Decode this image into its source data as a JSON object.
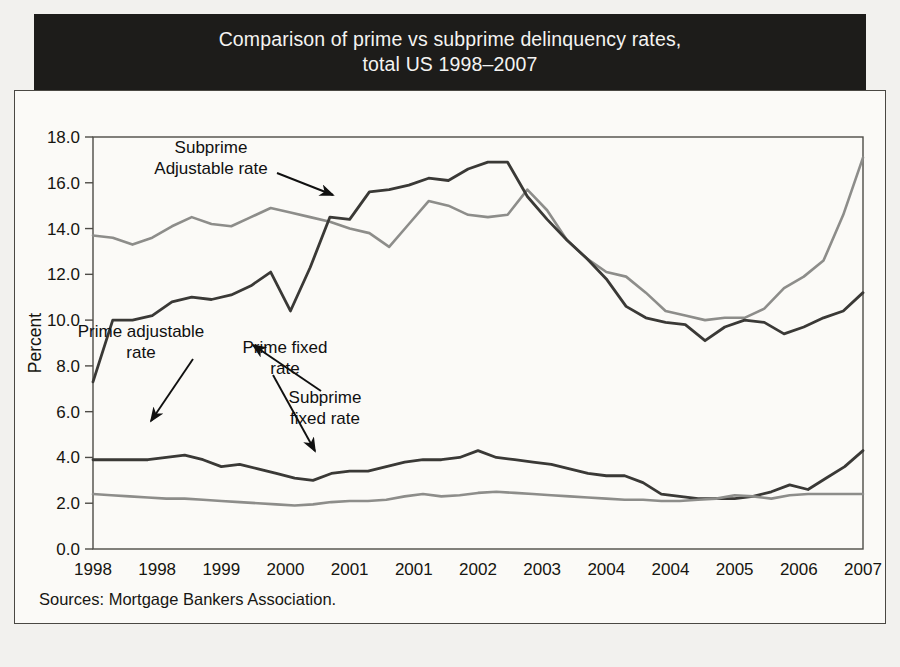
{
  "figure": {
    "title_line1": "Comparison of prime vs subprime delinquency rates,",
    "title_line2": "total US 1998–2007",
    "source": "Sources: Mortgage Bankers Association."
  },
  "colors": {
    "title_bg": "#1d1c1a",
    "title_fg": "#f4f3f1",
    "panel_bg": "#fbfaf7",
    "frame": "#4a4843",
    "subprime_adjustable": "#8d8d8a",
    "subprime_fixed": "#3a3936",
    "prime_adjustable": "#3a3936",
    "prime_fixed": "#8d8d8a"
  },
  "ghost_text": "quarter of 2007 are below the peak level of the third quarter of 2006. Since\nApril 2007, house prices fell in seventeen of the twenty metropolitan areas\nincluded in the index. Data from the national indices show a wide range of\nvalues, but those declines have been substantial in certain regions of the\ncountry.\n\nThe rise in delinquency rates in the subprime sector is shown\nin Fig. 2. Delinquency rates on subprime adjustable rate mortgages\nbottomed in 2004 at 10.0%, with a rise to 17.3% at year end 2007.\nThe prime sector remains substantially more stable: prime fixed rate\nloans hover near 2% and one might conclude that the delinquency rate\nin the prime market has not risen dramatically. Yet, the declines in 2007\nwere very sharp.\n\nThe subprime market accounts for a large share of all foreclosures, as\nsubprime originations, adjustable lending expanded and increased sharply\nin recent years. Thus, it may have been the case that some of the rise in",
  "chart_data": {
    "type": "line",
    "title": "Comparison of prime vs subprime delinquency rates, total US 1998–2007",
    "xlabel": "",
    "ylabel": "Percent",
    "ylim": [
      0.0,
      18.0
    ],
    "yticks": [
      0.0,
      2.0,
      4.0,
      6.0,
      8.0,
      10.0,
      12.0,
      14.0,
      16.0,
      18.0
    ],
    "ytick_labels": [
      "0.0",
      "2.0",
      "4.0",
      "6.0",
      "8.0",
      "10.0",
      "12.0",
      "14.0",
      "16.0",
      "18.0"
    ],
    "xtick_labels": [
      "1998",
      "1998",
      "1999",
      "2000",
      "2001",
      "2001",
      "2002",
      "2003",
      "2004",
      "2004",
      "2005",
      "2006",
      "2007"
    ],
    "x_index": [
      0,
      3,
      6,
      9,
      12,
      15,
      18,
      21,
      24,
      27,
      30,
      33,
      36
    ],
    "n_points": 40,
    "grid": false,
    "legend": "annotations",
    "series": [
      {
        "name": "Subprime Adjustable rate",
        "color": "#8d8d8a",
        "values": [
          13.7,
          13.6,
          13.3,
          13.6,
          14.1,
          14.5,
          14.2,
          14.1,
          14.5,
          14.9,
          14.7,
          14.5,
          14.3,
          14.0,
          13.8,
          13.2,
          14.2,
          15.2,
          15.0,
          14.6,
          14.5,
          14.6,
          15.7,
          14.8,
          13.5,
          12.7,
          12.1,
          11.9,
          11.2,
          10.4,
          10.2,
          10.0,
          10.1,
          10.1,
          10.5,
          11.4,
          11.9,
          12.6,
          14.6,
          17.1
        ]
      },
      {
        "name": "Subprime fixed rate",
        "color": "#3a3936",
        "values": [
          7.3,
          10.0,
          10.0,
          10.2,
          10.8,
          11.0,
          10.9,
          11.1,
          11.5,
          12.1,
          10.4,
          12.3,
          14.5,
          14.4,
          15.6,
          15.7,
          15.9,
          16.2,
          16.1,
          16.6,
          16.9,
          16.9,
          15.4,
          14.4,
          13.5,
          12.7,
          11.8,
          10.6,
          10.1,
          9.9,
          9.8,
          9.1,
          9.7,
          10.0,
          9.9,
          9.4,
          9.7,
          10.1,
          10.4,
          11.2
        ]
      },
      {
        "name": "Prime adjustable rate",
        "color": "#3a3936",
        "values": [
          3.9,
          3.9,
          3.9,
          3.9,
          4.0,
          4.1,
          3.9,
          3.6,
          3.7,
          3.5,
          3.3,
          3.1,
          3.0,
          3.3,
          3.4,
          3.4,
          3.6,
          3.8,
          3.9,
          3.9,
          4.0,
          4.3,
          4.0,
          3.9,
          3.8,
          3.7,
          3.5,
          3.3,
          3.2,
          3.2,
          2.9,
          2.4,
          2.3,
          2.2,
          2.2,
          2.2,
          2.3,
          2.5,
          2.8,
          2.6,
          3.1,
          3.6,
          4.3
        ]
      },
      {
        "name": "Prime fixed rate",
        "color": "#8d8d8a",
        "values": [
          2.4,
          2.35,
          2.3,
          2.25,
          2.2,
          2.2,
          2.15,
          2.1,
          2.05,
          2.0,
          1.95,
          1.9,
          1.95,
          2.05,
          2.1,
          2.1,
          2.15,
          2.3,
          2.4,
          2.3,
          2.35,
          2.45,
          2.5,
          2.45,
          2.4,
          2.35,
          2.3,
          2.25,
          2.2,
          2.15,
          2.15,
          2.1,
          2.1,
          2.15,
          2.2,
          2.35,
          2.3,
          2.2,
          2.35,
          2.4,
          2.4,
          2.4,
          2.4
        ]
      }
    ],
    "annotations": [
      {
        "id": "subprime-adjustable",
        "line1": "Subprime",
        "line2": "Adjustable rate"
      },
      {
        "id": "subprime-fixed",
        "line1": "Subprime",
        "line2": "fixed rate"
      },
      {
        "id": "prime-adjustable",
        "line1": "Prime adjustable",
        "line2": "rate"
      },
      {
        "id": "prime-fixed",
        "line1": "Prime fixed",
        "line2": "rate"
      }
    ]
  }
}
